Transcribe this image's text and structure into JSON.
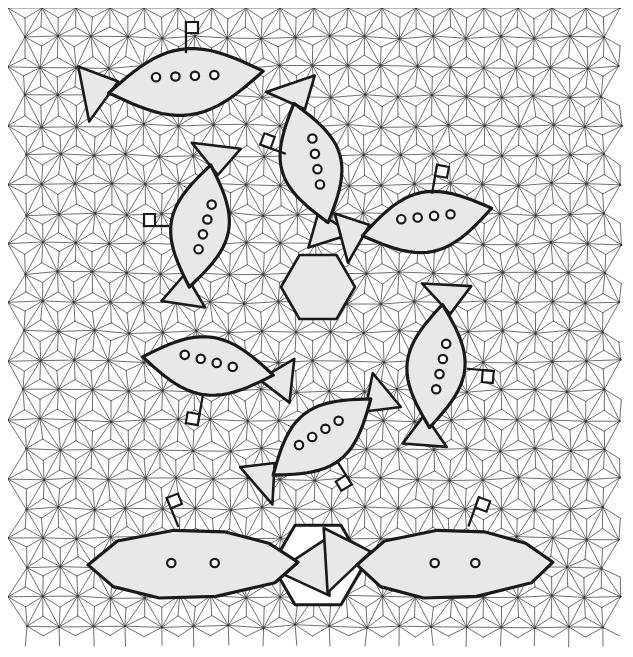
{
  "figure": {
    "width": 633,
    "height": 657,
    "background_color": "#ffffff",
    "mesh": {
      "name": "background-triangular-mesh",
      "line_color": "#4a4a4a",
      "line_width": 0.8,
      "node_color": "#333333",
      "domain": {
        "x": 8,
        "y": 8,
        "width": 617,
        "height": 641
      },
      "cell_size": 34,
      "description": "Uniform triangulated grid of hexagonal macro-cells, each subdivided into 6 triangles plus cross bracing"
    },
    "feature_outline": {
      "name": "feature-outline",
      "stroke_color": "#1a1a1a",
      "stroke_width": 3.2,
      "fill_color": "#e8e8e8"
    },
    "porthole": {
      "name": "porthole",
      "stroke_color": "#1a1a1a",
      "fill_color": "#ffffff",
      "radius": 4.2,
      "stroke_width": 2.2
    },
    "hexagons": [
      {
        "name": "center-hexagon",
        "cx": 318,
        "cy": 287,
        "r": 37,
        "fill": "#e8e8e8",
        "stroke": "#1a1a1a",
        "stroke_width": 2.6,
        "label": "central hexagonal cell"
      },
      {
        "name": "bottom-hexagon",
        "cx": 318,
        "cy": 565,
        "r": 46,
        "fill": "#ffffff",
        "stroke": "#1a1a1a",
        "stroke_width": 3.0,
        "label": "bottom hexagonal cell"
      }
    ],
    "submarines": [
      {
        "id": "sub-top-left",
        "label": "submarine-top-left",
        "cx": 186,
        "cy": 82,
        "rx": 78,
        "ry": 33,
        "rotation": -8,
        "portholes": 4,
        "flag": {
          "angle": -90,
          "offset": 30,
          "height": 30
        },
        "fin_left": true,
        "fin_right": false,
        "dense_mesh": true
      },
      {
        "id": "sub-upper-center",
        "label": "submarine-upper-center",
        "cx": 311,
        "cy": 163,
        "rx": 62,
        "ry": 30,
        "rotation": 74,
        "portholes": 4,
        "flag": {
          "angle": -160,
          "offset": 28,
          "height": 26
        },
        "fin_left": true,
        "fin_right": true,
        "dense_mesh": false
      },
      {
        "id": "sub-left-upper",
        "label": "submarine-left-upper",
        "cx": 200,
        "cy": 226,
        "rx": 62,
        "ry": 29,
        "rotation": 100,
        "portholes": 4,
        "flag": {
          "angle": 180,
          "offset": 32,
          "height": 24
        },
        "fin_left": true,
        "fin_right": true,
        "dense_mesh": false
      },
      {
        "id": "sub-right-upper",
        "label": "submarine-right-upper",
        "cx": 427,
        "cy": 222,
        "rx": 66,
        "ry": 30,
        "rotation": -12,
        "portholes": 4,
        "flag": {
          "angle": -80,
          "offset": 30,
          "height": 28
        },
        "fin_left": true,
        "fin_right": false,
        "dense_mesh": false
      },
      {
        "id": "sub-left-middle",
        "label": "submarine-left-middle",
        "cx": 208,
        "cy": 366,
        "rx": 66,
        "ry": 29,
        "rotation": 8,
        "portholes": 4,
        "flag": {
          "angle": 100,
          "offset": 30,
          "height": 30
        },
        "fin_left": false,
        "fin_right": true,
        "dense_mesh": false
      },
      {
        "id": "sub-right-middle",
        "label": "submarine-right-middle",
        "cx": 436,
        "cy": 366,
        "rx": 62,
        "ry": 29,
        "rotation": 96,
        "portholes": 4,
        "flag": {
          "angle": 5,
          "offset": 32,
          "height": 26
        },
        "fin_left": true,
        "fin_right": true,
        "dense_mesh": false
      },
      {
        "id": "sub-lower-center",
        "label": "submarine-lower-center",
        "cx": 322,
        "cy": 437,
        "rx": 62,
        "ry": 29,
        "rotation": -38,
        "portholes": 4,
        "flag": {
          "angle": 58,
          "offset": 30,
          "height": 26
        },
        "fin_left": true,
        "fin_right": true,
        "dense_mesh": false
      },
      {
        "id": "sub-bottom-left",
        "label": "submarine-bottom-left",
        "cx": 193,
        "cy": 563,
        "rx": 105,
        "ry": 38,
        "rotation": 0,
        "portholes": 2,
        "flag": {
          "angle": -112,
          "offset": 40,
          "height": 30
        },
        "fin_left": false,
        "fin_right": true,
        "wide": true,
        "dense_mesh": false
      },
      {
        "id": "sub-bottom-right",
        "label": "submarine-bottom-right",
        "cx": 455,
        "cy": 563,
        "rx": 98,
        "ry": 38,
        "rotation": 0,
        "portholes": 2,
        "flag": {
          "angle": -70,
          "offset": 40,
          "height": 30
        },
        "fin_left": true,
        "fin_right": false,
        "wide": true,
        "dense_mesh": false
      }
    ]
  }
}
